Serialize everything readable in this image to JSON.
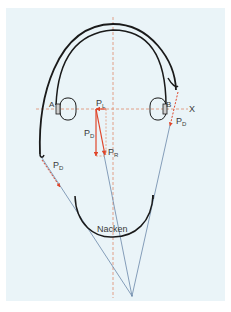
{
  "diagram": {
    "type": "headphone-force-diagram",
    "background_color": "#eaf4f8",
    "colors": {
      "headband": "#1a1a1a",
      "force_vectors": "#e0452a",
      "dashed_axes": "#e08a6a",
      "construction_lines": "#6a86a8",
      "label_text": "#3a3a3a"
    },
    "labels": {
      "point_a": "A",
      "point_b": "B",
      "axis_x": "X",
      "p_l": {
        "main": "P",
        "sub": "L"
      },
      "p_d_center": {
        "main": "P",
        "sub": "D"
      },
      "p_r": {
        "main": "P",
        "sub": "R"
      },
      "p_d_right": {
        "main": "P",
        "sub": "D"
      },
      "p_d_left": {
        "main": "P",
        "sub": "D"
      },
      "neck": "Nacken"
    }
  }
}
